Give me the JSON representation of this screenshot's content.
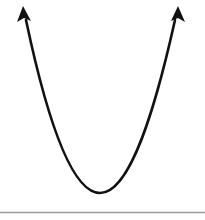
{
  "diagram": {
    "type": "parabola",
    "curve_color": "#111111",
    "baseline_color": "#9a9a9a",
    "background": "#ffffff",
    "left_arrow_tip": [
      23,
      8
    ],
    "right_arrow_tip": [
      178,
      8
    ],
    "vertex": [
      100,
      193
    ],
    "baseline_y": 212
  }
}
